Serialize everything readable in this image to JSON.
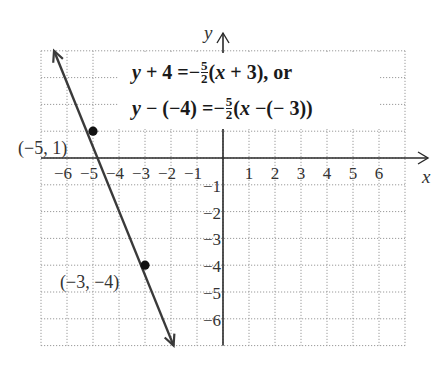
{
  "chart_data": {
    "type": "line",
    "title": "",
    "xlabel": "x",
    "ylabel": "y",
    "xlim": [
      -7,
      7
    ],
    "ylim": [
      -7,
      4
    ],
    "grid": true,
    "grid_style": "dotted",
    "x_ticks": [
      -6,
      -5,
      -4,
      -3,
      -2,
      -1,
      1,
      2,
      3,
      4,
      5,
      6
    ],
    "x_tick_labels": [
      "−6",
      "−5",
      "−4",
      "−3",
      "−2",
      "−1",
      "1",
      "2",
      "3",
      "4",
      "5",
      "6"
    ],
    "y_ticks": [
      -1,
      -2,
      -3,
      -4,
      -5,
      -6
    ],
    "y_tick_labels": [
      "−1",
      "−2",
      "−3",
      "−4",
      "−5",
      "−6"
    ],
    "series": [
      {
        "name": "y + 4 = -5/2(x + 3)",
        "slope": -2.5,
        "line_from": [
          -6.5,
          4.0
        ],
        "line_to": [
          -1.9,
          -7.0
        ],
        "arrows": "both",
        "color": "#3a3a3a"
      }
    ],
    "points": [
      {
        "x": -5,
        "y": 1,
        "label": "(−5, 1)"
      },
      {
        "x": -3,
        "y": -4,
        "label": "(−3, −4)"
      }
    ],
    "annotations": [
      {
        "line": 1,
        "parts": [
          "y + 4 =−",
          "5",
          "2",
          "(x + 3), or"
        ]
      },
      {
        "line": 2,
        "parts": [
          "y − (−4) =−",
          "5",
          "2",
          "(x −(− 3))"
        ]
      }
    ]
  },
  "equation": {
    "line1_prefix_var": "y",
    "line1_prefix": " + 4 =−",
    "line1_num": "5",
    "line1_den": "2",
    "line1_open": "(",
    "line1_var": "x",
    "line1_suffix": " + 3), or",
    "line2_prefix_var": "y",
    "line2_prefix": " − (−4) =−",
    "line2_num": "5",
    "line2_den": "2",
    "line2_open": "(",
    "line2_var": "x",
    "line2_suffix": " −(− 3))"
  },
  "labels": {
    "x_axis": "x",
    "y_axis": "y",
    "point_a": "(−5, 1)",
    "point_b": "(−3, −4)"
  },
  "colors": {
    "line": "#3a3a3a",
    "axis": "#2a2a2a",
    "grid": "#9a9a9a",
    "point": "#111111"
  }
}
